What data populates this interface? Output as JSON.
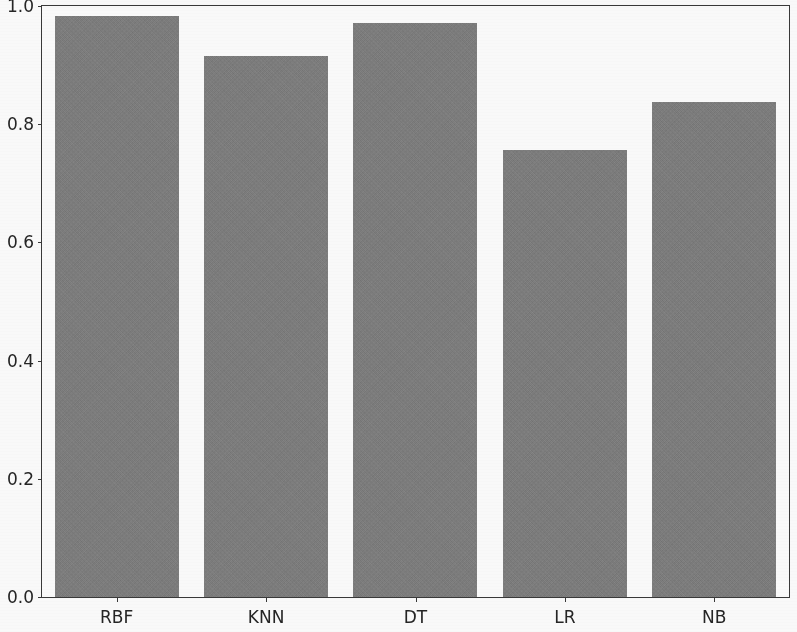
{
  "chart_data": {
    "type": "bar",
    "title": "",
    "xlabel": "",
    "ylabel": "",
    "categories": [
      "RBF",
      "KNN",
      "DT",
      "LR",
      "NB"
    ],
    "values": [
      0.983,
      0.915,
      0.971,
      0.757,
      0.838
    ],
    "ylim": [
      0.0,
      1.0
    ],
    "yticks": [
      "0.0",
      "0.2",
      "0.4",
      "0.6",
      "0.8",
      "1.0"
    ],
    "ytick_values": [
      0.0,
      0.2,
      0.4,
      0.6,
      0.8,
      1.0
    ],
    "grid": false,
    "legend": null,
    "bar_color": "#7f7f7f",
    "axis_color": "#3a3a3a",
    "background_color": "#ffffff",
    "bar_width_fraction": 0.83
  }
}
